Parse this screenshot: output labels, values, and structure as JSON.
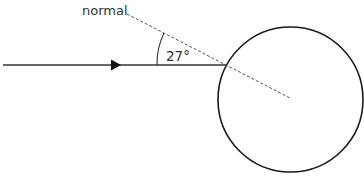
{
  "diagram": {
    "normal_label": "normal",
    "angle_label": "27°",
    "angle_degrees": 27,
    "colors": {
      "stroke": "#1a1a1a",
      "ray": "#333333",
      "dashed": "#555555",
      "text": "#333333"
    }
  }
}
